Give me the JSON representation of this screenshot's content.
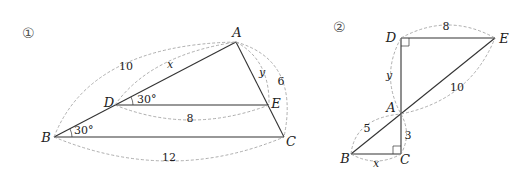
{
  "figures": [
    {
      "index_label": "①",
      "points": {
        "A": "A",
        "B": "B",
        "C": "C",
        "D": "D",
        "E": "E"
      },
      "lengths": {
        "AB": "10",
        "AD": "x",
        "AE": "y",
        "AC": "6",
        "DE": "8",
        "BC": "12"
      },
      "angles": {
        "ADE": "30°",
        "ABC": "30°"
      }
    },
    {
      "index_label": "②",
      "points": {
        "A": "A",
        "B": "B",
        "C": "C",
        "D": "D",
        "E": "E"
      },
      "lengths": {
        "DE": "8",
        "AD": "y",
        "AE": "10",
        "AB": "5",
        "AC": "3",
        "BC": "x"
      },
      "right_angles": [
        "D",
        "C"
      ]
    }
  ]
}
